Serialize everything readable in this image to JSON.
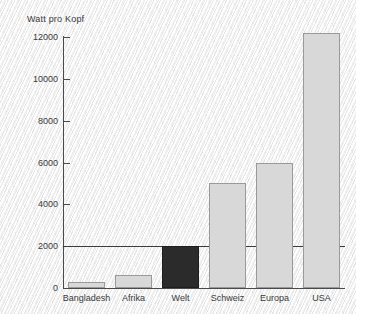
{
  "chart_data": {
    "type": "bar",
    "title": "",
    "xlabel": "",
    "ylabel": "Watt pro Kopf",
    "categories": [
      "Bangladesh",
      "Afrika",
      "Welt",
      "Schweiz",
      "Europa",
      "USA"
    ],
    "values": [
      280,
      600,
      2000,
      5000,
      6000,
      12200
    ],
    "ylim": [
      0,
      12600
    ],
    "yticks": [
      0,
      2000,
      4000,
      6000,
      8000,
      10000,
      12000
    ],
    "ytick_labels": [
      "0",
      "2000",
      "4000",
      "6000",
      "8000",
      "10000",
      "12000"
    ],
    "grid": false,
    "legend": "none",
    "reference_line": {
      "value": 2000,
      "label": ""
    },
    "bar_colors": [
      "#d8d8d8",
      "#d8d8d8",
      "#2b2b2b",
      "#d8d8d8",
      "#d8d8d8",
      "#d8d8d8"
    ],
    "highlight_category": "Welt",
    "colors": {
      "bar_fill": "#d8d8d8",
      "bar_highlight": "#2b2b2b",
      "bar_border": "#9a9a9a",
      "axis": "#4a4a4a",
      "text": "#3a3a3a",
      "panel_background": "#f2f2f2"
    }
  }
}
